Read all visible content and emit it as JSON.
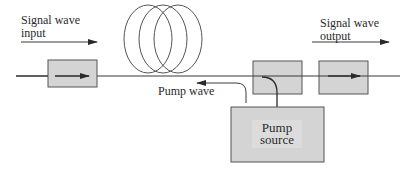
{
  "diagram": {
    "type": "fiber amplifier (backward pumped)",
    "labels": {
      "signal_input_line1": "Signal wave",
      "signal_input_line2": "input",
      "signal_output_line1": "Signal wave",
      "signal_output_line2": "output",
      "pump_wave": "Pump wave",
      "pump_source_line1": "Pump",
      "pump_source_line2": "source"
    },
    "components": [
      {
        "id": "input-isolator",
        "kind": "isolator"
      },
      {
        "id": "fiber-coil",
        "kind": "doped fiber coil",
        "loops": 3
      },
      {
        "id": "wdm-coupler",
        "kind": "coupler"
      },
      {
        "id": "output-isolator",
        "kind": "isolator"
      },
      {
        "id": "pump-source",
        "kind": "pump laser"
      }
    ],
    "colors": {
      "box_fill": "#d4d4d4",
      "box_inner_fill": "#dcdcdc",
      "stroke": "#3a3a3a",
      "background": "#ffffff"
    }
  }
}
